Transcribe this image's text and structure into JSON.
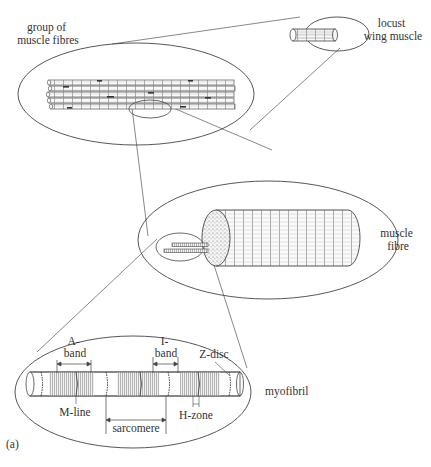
{
  "figure": {
    "panel_label": "(a)"
  },
  "levels": [
    {
      "id": "locust",
      "label_lines": [
        "locust",
        "wing muscle"
      ]
    },
    {
      "id": "group",
      "label_lines": [
        "group of",
        "muscle fibres"
      ]
    },
    {
      "id": "fibre",
      "label_lines": [
        "muscle",
        "fibre"
      ]
    },
    {
      "id": "myofibril",
      "label_lines": [
        "myofibril"
      ]
    }
  ],
  "myofibril_annotations": {
    "a_band": [
      "A-",
      "band"
    ],
    "i_band": [
      "I-",
      "band"
    ],
    "z_disc": "Z-disc",
    "m_line": "M-line",
    "h_zone": "H-zone",
    "sarcomere": "sarcomere"
  },
  "colors": {
    "line": "#444444",
    "text": "#333333",
    "background": "#ffffff"
  }
}
